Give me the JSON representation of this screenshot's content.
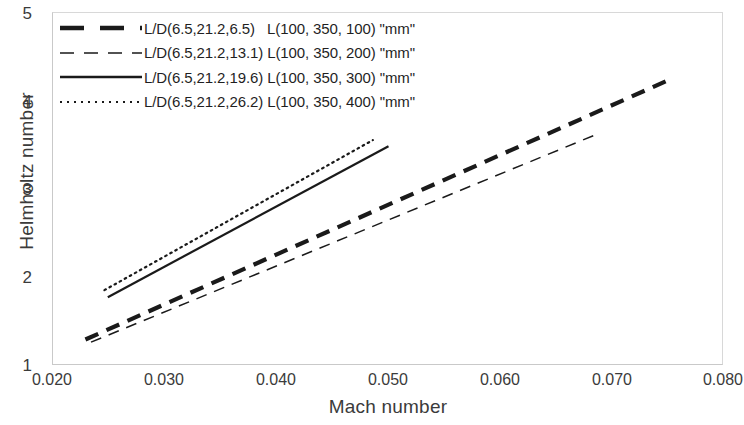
{
  "chart_data": {
    "type": "line",
    "title": "",
    "xlabel": "Mach number",
    "ylabel": "Helmholtz number",
    "xlim": [
      0.02,
      0.08
    ],
    "ylim": [
      1,
      5
    ],
    "xticks": [
      "0.020",
      "0.030",
      "0.040",
      "0.050",
      "0.060",
      "0.070",
      "0.080"
    ],
    "xtick_values": [
      0.02,
      0.03,
      0.04,
      0.05,
      0.06,
      0.07,
      0.08
    ],
    "yticks": [
      "1",
      "2",
      "3",
      "4",
      "5"
    ],
    "ytick_values": [
      1,
      2,
      3,
      4,
      5
    ],
    "grid": false,
    "legend_position": "top-left",
    "series": [
      {
        "name": "L/D(6.5,21.2,6.5)   L(100, 350, 100) \"mm\"",
        "style": "thick-dashed",
        "color": "#1a1a1a",
        "width": 4.2,
        "dash": "14,9",
        "x": [
          0.0229,
          0.0754
        ],
        "y": [
          1.3,
          4.26
        ]
      },
      {
        "name": "L/D(6.5,21.2,13.1) L(100, 350, 200) \"mm\"",
        "style": "thin-dashed",
        "color": "#1a1a1a",
        "width": 1.5,
        "dash": "11,8",
        "x": [
          0.0234,
          0.0689
        ],
        "y": [
          1.27,
          3.64
        ]
      },
      {
        "name": "L/D(6.5,21.2,19.6) L(100, 350, 300) \"mm\"",
        "style": "solid",
        "color": "#1a1a1a",
        "width": 2.2,
        "dash": "none",
        "x": [
          0.0249,
          0.05
        ],
        "y": [
          1.78,
          3.49
        ]
      },
      {
        "name": "L/D(6.5,21.2,26.2) L(100, 350, 400) \"mm\"",
        "style": "dotted",
        "color": "#1a1a1a",
        "width": 2.2,
        "dash": "1.6,4.2",
        "x": [
          0.0246,
          0.0486
        ],
        "y": [
          1.86,
          3.56
        ]
      }
    ]
  },
  "axes": {
    "x_title": "Mach number",
    "y_title": "Helmholtz number",
    "x_tick_labels": [
      "0.020",
      "0.030",
      "0.040",
      "0.050",
      "0.060",
      "0.070",
      "0.080"
    ],
    "y_tick_labels": [
      "5",
      "4",
      "3",
      "2",
      "1"
    ]
  },
  "legend": {
    "entries": [
      {
        "label": "L/D(6.5,21.2,6.5)   L(100, 350, 100) \"mm\""
      },
      {
        "label": "L/D(6.5,21.2,13.1) L(100, 350, 200) \"mm\""
      },
      {
        "label": "L/D(6.5,21.2,19.6) L(100, 350, 300) \"mm\""
      },
      {
        "label": "L/D(6.5,21.2,26.2) L(100, 350, 400) \"mm\""
      }
    ]
  },
  "colors": {
    "line": "#1a1a1a",
    "axis": "#c9c9c9",
    "text": "#3b3b3b"
  }
}
